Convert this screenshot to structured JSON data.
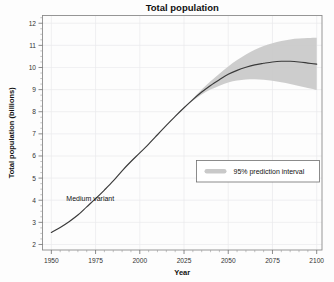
{
  "chart_data": {
    "type": "line",
    "title": "Total population",
    "xlabel": "Year",
    "ylabel": "Total population (billions)",
    "xlim": [
      1945,
      2103
    ],
    "ylim": [
      1.75,
      12.35
    ],
    "grid": true,
    "xticks": [
      1950,
      1975,
      2000,
      2025,
      2050,
      2075,
      2100
    ],
    "xtick_labels": [
      "1950",
      "1975",
      "2000",
      "2025",
      "2050",
      "2075",
      "2100"
    ],
    "yticks": [
      2,
      3,
      4,
      5,
      6,
      7,
      8,
      9,
      10,
      11,
      12
    ],
    "ytick_labels": [
      "2",
      "3",
      "4",
      "5",
      "6",
      "7",
      "8",
      "9",
      "10",
      "11",
      "12"
    ],
    "x": [
      1950,
      1955,
      1960,
      1965,
      1970,
      1975,
      1980,
      1985,
      1990,
      1995,
      2000,
      2005,
      2010,
      2015,
      2020,
      2025,
      2030,
      2035,
      2040,
      2045,
      2050,
      2055,
      2060,
      2065,
      2070,
      2075,
      2080,
      2085,
      2090,
      2095,
      2100
    ],
    "series": [
      {
        "name": "Medium variant",
        "values": [
          2.54,
          2.77,
          3.03,
          3.33,
          3.7,
          4.07,
          4.46,
          4.87,
          5.33,
          5.75,
          6.14,
          6.54,
          6.96,
          7.38,
          7.79,
          8.18,
          8.55,
          8.89,
          9.19,
          9.45,
          9.69,
          9.87,
          10.01,
          10.12,
          10.19,
          10.25,
          10.28,
          10.28,
          10.25,
          10.2,
          10.15
        ]
      },
      {
        "name": "95% prediction interval upper",
        "values": [
          2.54,
          2.77,
          3.03,
          3.33,
          3.7,
          4.07,
          4.46,
          4.87,
          5.33,
          5.75,
          6.14,
          6.54,
          6.96,
          7.38,
          7.79,
          8.19,
          8.6,
          9.0,
          9.38,
          9.72,
          10.05,
          10.34,
          10.59,
          10.8,
          10.97,
          11.1,
          11.2,
          11.27,
          11.31,
          11.33,
          11.34
        ]
      },
      {
        "name": "95% prediction interval lower",
        "values": [
          2.54,
          2.77,
          3.03,
          3.33,
          3.7,
          4.07,
          4.46,
          4.87,
          5.33,
          5.75,
          6.14,
          6.54,
          6.96,
          7.38,
          7.79,
          8.17,
          8.5,
          8.78,
          9.0,
          9.18,
          9.32,
          9.41,
          9.46,
          9.47,
          9.45,
          9.4,
          9.33,
          9.25,
          9.16,
          9.07,
          8.98
        ]
      }
    ],
    "annotations": [
      {
        "text": "Medium variant",
        "x": 1972,
        "y": 3.95
      }
    ],
    "legend": {
      "position": "center-right",
      "entries": [
        {
          "label": "95% prediction interval",
          "swatch_color": "#c9c9c9",
          "marker": "band"
        }
      ]
    },
    "colors": {
      "median_line": "#3a3a3a",
      "interval_band": "#c9c9c9",
      "grid": "#e9e9ec",
      "frame": "#8c8c8c",
      "background": "#fdfdfd"
    }
  }
}
